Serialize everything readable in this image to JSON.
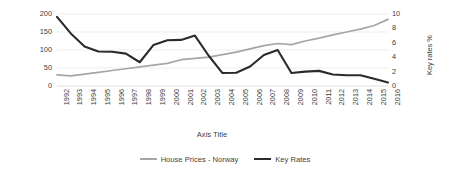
{
  "chart_data": {
    "type": "line",
    "title": "",
    "xlabel": "Axis Title",
    "ylabel": "House price changes %",
    "y2label": "Key rates %",
    "ylim": [
      0,
      200
    ],
    "y2lim": [
      0,
      10
    ],
    "grid": true,
    "legend_position": "bottom",
    "categories": [
      "1992",
      "1993",
      "1994",
      "1995",
      "1996",
      "1997",
      "1998",
      "1999",
      "2000",
      "2001",
      "2002",
      "2003",
      "2004",
      "2005",
      "2006",
      "2007",
      "2008",
      "2009",
      "2010",
      "2011",
      "2012",
      "2013",
      "2014",
      "2015",
      "2016"
    ],
    "yticks_left": [
      "0",
      "50",
      "100",
      "150",
      "200"
    ],
    "yticks_right": [
      "0",
      "2",
      "4",
      "6",
      "8",
      "10"
    ],
    "series": [
      {
        "name": "House Prices - Norway",
        "axis": "left",
        "color": "#a6a6a6",
        "values": [
          31,
          28,
          33,
          38,
          43,
          48,
          53,
          58,
          63,
          73,
          77,
          80,
          87,
          94,
          103,
          112,
          118,
          115,
          125,
          133,
          142,
          150,
          158,
          168,
          185
        ]
      },
      {
        "name": "Key Rates",
        "axis": "right",
        "color": "#2b2b2b",
        "values": [
          9.6,
          7.3,
          5.5,
          4.8,
          4.75,
          4.5,
          3.3,
          5.7,
          6.35,
          6.4,
          7.0,
          4.2,
          1.8,
          1.85,
          2.7,
          4.3,
          5.0,
          1.8,
          2.0,
          2.1,
          1.6,
          1.5,
          1.5,
          1.0,
          0.5
        ]
      }
    ]
  }
}
